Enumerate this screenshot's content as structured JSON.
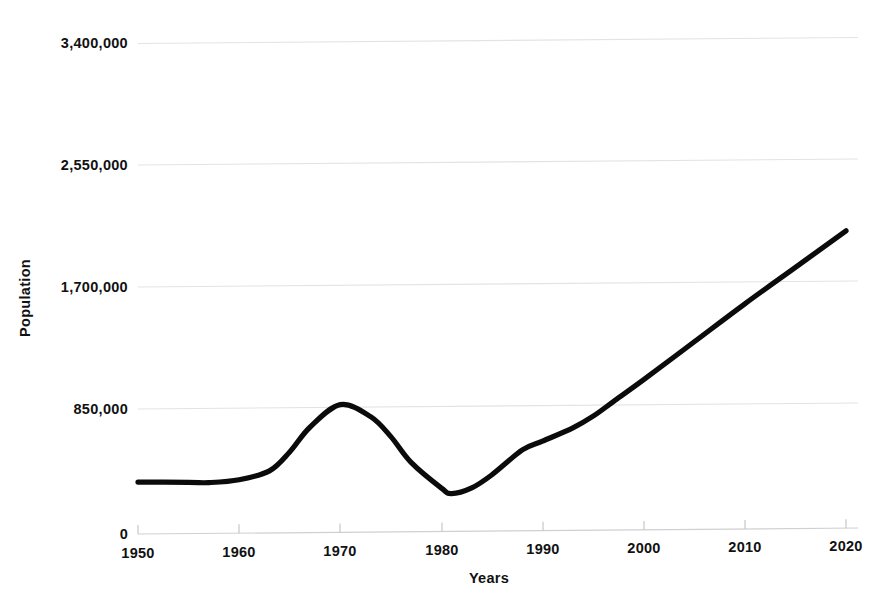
{
  "chart_data": {
    "type": "line",
    "title": "",
    "xlabel": "Years",
    "ylabel": "Population",
    "xlim": [
      1950,
      2020
    ],
    "ylim": [
      0,
      3400000
    ],
    "grid": true,
    "legend": "none",
    "x_tick_labels": [
      "1950",
      "1960",
      "1970",
      "1980",
      "1990",
      "2000",
      "2010",
      "2020"
    ],
    "x_ticks": [
      1950,
      1960,
      1970,
      1980,
      1990,
      2000,
      2010,
      2020
    ],
    "y_tick_labels": [
      "0",
      "850,000",
      "1,700,000",
      "2,550,000",
      "3,400,000"
    ],
    "y_ticks": [
      0,
      850000,
      1700000,
      2550000,
      3400000
    ],
    "series": [
      {
        "name": "Population",
        "color": "#0b0b0b",
        "x": [
          1950,
          1955,
          1957,
          1960,
          1963,
          1965,
          1967,
          1970,
          1973,
          1975,
          1977,
          1980,
          1981,
          1983,
          1985,
          1988,
          1990,
          1993,
          1995,
          1997,
          2000,
          2005,
          2010,
          2015,
          2020
        ],
        "values": [
          360000,
          355000,
          352000,
          370000,
          430000,
          560000,
          730000,
          885000,
          800000,
          660000,
          480000,
          300000,
          262000,
          300000,
          390000,
          560000,
          620000,
          710000,
          790000,
          890000,
          1040000,
          1300000,
          1560000,
          1810000,
          2060000
        ]
      }
    ]
  },
  "axis_titles": {
    "x": "Years",
    "y": "Population"
  }
}
